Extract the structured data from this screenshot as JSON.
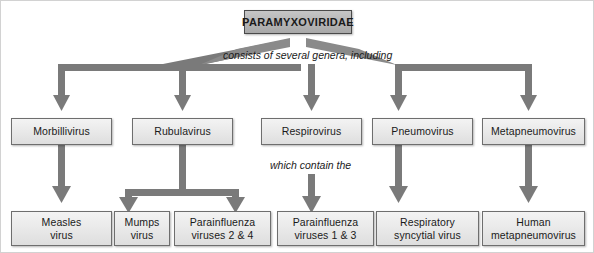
{
  "diagram": {
    "background_color": "#ffffff",
    "connector_color": "#787878",
    "root_fill_color": "#b4b4b4",
    "node_fill_color": "#e8e8e8",
    "node_border_color": "#6e6e6e",
    "root": {
      "label": "PARAMYXOVIRIDAE"
    },
    "edge_labels": [
      {
        "id": "genera",
        "text": "consists of several genera, including"
      },
      {
        "id": "contain",
        "text": "which contain the"
      }
    ],
    "genera": [
      {
        "id": "morbillivirus",
        "label": "Morbillivirus"
      },
      {
        "id": "rubulavirus",
        "label": "Rubulavirus"
      },
      {
        "id": "respirovirus",
        "label": "Respirovirus"
      },
      {
        "id": "pneumovirus",
        "label": "Pneumovirus"
      },
      {
        "id": "metapneumovirus",
        "label": "Metapneumovirus"
      }
    ],
    "species": [
      {
        "id": "measles",
        "line1": "Measles",
        "line2": "virus"
      },
      {
        "id": "mumps",
        "line1": "Mumps",
        "line2": "virus"
      },
      {
        "id": "piv24",
        "line1": "Parainfluenza",
        "line2": "viruses 2 & 4"
      },
      {
        "id": "piv13",
        "line1": "Parainfluenza",
        "line2": "viruses 1 & 3"
      },
      {
        "id": "rsv",
        "line1": "Respiratory",
        "line2": "syncytial virus"
      },
      {
        "id": "hmpv",
        "line1": "Human",
        "line2": "metapneumovirus"
      }
    ]
  }
}
